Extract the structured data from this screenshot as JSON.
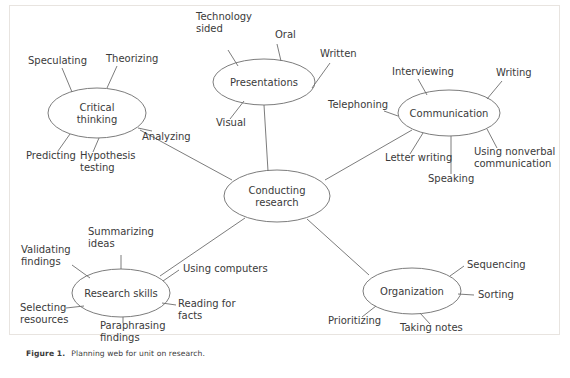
{
  "figure": {
    "caption_label": "Figure 1.",
    "caption_text": "Planning web for unit on research.",
    "border_color": "#e8e4e0",
    "line_color": "#6d6d6d",
    "text_color": "#3a3a3a",
    "background": "#ffffff"
  },
  "diagram_data": {
    "type": "mind-map",
    "center": {
      "id": "conducting-research",
      "label_line1": "Conducting",
      "label_line2": "research",
      "cx": 277,
      "cy": 196,
      "rx": 53,
      "ry": 26
    },
    "branches": [
      {
        "id": "critical-thinking",
        "label_line1": "Critical",
        "label_line2": "thinking",
        "cx": 97,
        "cy": 113,
        "rx": 49,
        "ry": 25,
        "leaves": [
          {
            "id": "speculating",
            "text": "Speculating",
            "x": 28,
            "y": 64,
            "anchor": "start",
            "ex": 72,
            "ey": 92,
            "lx": 62,
            "ly": 68
          },
          {
            "id": "theorizing",
            "text": "Theorizing",
            "x": 106,
            "y": 62,
            "anchor": "start",
            "ex": 107,
            "ey": 88,
            "lx": 117,
            "ly": 66
          },
          {
            "id": "analyzing",
            "text": "Analyzing",
            "x": 142,
            "y": 140,
            "anchor": "start",
            "ex": 138,
            "ey": 128,
            "lx": 152,
            "ly": 131
          },
          {
            "id": "predicting",
            "text": "Predicting",
            "x": 26,
            "y": 159,
            "anchor": "start",
            "ex": 70,
            "ey": 134,
            "lx": 58,
            "ly": 151
          },
          {
            "id": "hypothesis-testing",
            "text": "Hypothesis",
            "text2": "testing",
            "x": 80,
            "y": 159,
            "anchor": "start",
            "ex": 99,
            "ey": 138,
            "lx": 93,
            "ly": 152
          }
        ]
      },
      {
        "id": "presentations",
        "label_line1": "Presentations",
        "label_line2": "",
        "cx": 264,
        "cy": 82,
        "rx": 51,
        "ry": 23,
        "leaves": [
          {
            "id": "technology-sided",
            "text": "Technology",
            "text2": "sided",
            "x": 196,
            "y": 20,
            "anchor": "start",
            "ex": 238,
            "ey": 66,
            "lx": 228,
            "ly": 50
          },
          {
            "id": "oral",
            "text": "Oral",
            "x": 275,
            "y": 38,
            "anchor": "start",
            "ex": 281,
            "ey": 61,
            "lx": 277,
            "ly": 44
          },
          {
            "id": "written",
            "text": "Written",
            "x": 320,
            "y": 57,
            "anchor": "start",
            "ex": 312,
            "ey": 88,
            "lx": 330,
            "ly": 63
          },
          {
            "id": "visual",
            "text": "Visual",
            "x": 216,
            "y": 126,
            "anchor": "start",
            "ex": 244,
            "ey": 101,
            "lx": 230,
            "ly": 119
          }
        ]
      },
      {
        "id": "communication",
        "label_line1": "Communication",
        "label_line2": "",
        "cx": 449,
        "cy": 113,
        "rx": 51,
        "ry": 23,
        "leaves": [
          {
            "id": "interviewing",
            "text": "Interviewing",
            "x": 392,
            "y": 75,
            "anchor": "start",
            "ex": 427,
            "ey": 95,
            "lx": 418,
            "ly": 79
          },
          {
            "id": "writing",
            "text": "Writing",
            "x": 496,
            "y": 76,
            "anchor": "start",
            "ex": 487,
            "ey": 99,
            "lx": 502,
            "ly": 81
          },
          {
            "id": "telephoning",
            "text": "Telephoning",
            "x": 328,
            "y": 108,
            "anchor": "start",
            "ex": 398,
            "ey": 116,
            "lx": 384,
            "ly": 111
          },
          {
            "id": "letter-writing",
            "text": "Letter writing",
            "x": 385,
            "y": 161,
            "anchor": "start",
            "ex": 423,
            "ey": 133,
            "lx": 410,
            "ly": 154
          },
          {
            "id": "speaking",
            "text": "Speaking",
            "x": 428,
            "y": 182,
            "anchor": "start",
            "ex": 451,
            "ey": 136,
            "lx": 451,
            "ly": 174
          },
          {
            "id": "using-nonverbal",
            "text": "Using nonverbal",
            "text2": "communication",
            "x": 474,
            "y": 155,
            "anchor": "start",
            "ex": 487,
            "ey": 129,
            "lx": 497,
            "ly": 148
          }
        ]
      },
      {
        "id": "research-skills",
        "label_line1": "Research skills",
        "label_line2": "",
        "cx": 121,
        "cy": 293,
        "rx": 49,
        "ry": 24,
        "leaves": [
          {
            "id": "summarizing-ideas",
            "text": "Summarizing",
            "text2": "ideas",
            "x": 88,
            "y": 235,
            "anchor": "start",
            "ex": 121,
            "ey": 269,
            "lx": 121,
            "ly": 255
          },
          {
            "id": "validating-findings",
            "text": "Validating",
            "text2": "findings",
            "x": 21,
            "y": 253,
            "anchor": "start",
            "ex": 90,
            "ey": 278,
            "lx": 72,
            "ly": 265
          },
          {
            "id": "using-computers",
            "text": "Using computers",
            "x": 183,
            "y": 272,
            "anchor": "start",
            "ex": 163,
            "ey": 281,
            "lx": 179,
            "ly": 270
          },
          {
            "id": "selecting-resources",
            "text": "Selecting",
            "text2": "resources",
            "x": 20,
            "y": 311,
            "anchor": "start",
            "ex": 84,
            "ey": 306,
            "lx": 66,
            "ly": 308
          },
          {
            "id": "paraphrasing-findings",
            "text": "Paraphrasing",
            "text2": "findings",
            "x": 100,
            "y": 329,
            "anchor": "start",
            "ex": 123,
            "ey": 317,
            "lx": 123,
            "ly": 323
          },
          {
            "id": "reading-for-facts",
            "text": "Reading for",
            "text2": "facts",
            "x": 178,
            "y": 307,
            "anchor": "start",
            "ex": 162,
            "ey": 303,
            "lx": 176,
            "ly": 305
          }
        ]
      },
      {
        "id": "organization",
        "label_line1": "Organization",
        "label_line2": "",
        "cx": 412,
        "cy": 291,
        "rx": 49,
        "ry": 23,
        "leaves": [
          {
            "id": "sequencing",
            "text": "Sequencing",
            "x": 467,
            "y": 268,
            "anchor": "start",
            "ex": 450,
            "ey": 276,
            "lx": 464,
            "ly": 266
          },
          {
            "id": "sorting",
            "text": "Sorting",
            "x": 478,
            "y": 298,
            "anchor": "start",
            "ex": 458,
            "ey": 294,
            "lx": 474,
            "ly": 295
          },
          {
            "id": "prioritizing",
            "text": "Prioritizing",
            "x": 328,
            "y": 324,
            "anchor": "start",
            "ex": 376,
            "ey": 306,
            "lx": 362,
            "ly": 317
          },
          {
            "id": "taking-notes",
            "text": "Taking notes",
            "x": 400,
            "y": 331,
            "anchor": "start",
            "ex": 420,
            "ey": 313,
            "lx": 430,
            "ly": 324
          }
        ]
      }
    ],
    "spokes": [
      {
        "id": "center-to-presentations",
        "x1": 264,
        "y1": 105,
        "x2": 268,
        "y2": 171
      },
      {
        "id": "center-to-critical-thinking",
        "x1": 140,
        "y1": 130,
        "x2": 232,
        "y2": 180
      },
      {
        "id": "center-to-communication",
        "x1": 412,
        "y1": 130,
        "x2": 325,
        "y2": 180
      },
      {
        "id": "center-to-research-skills",
        "x1": 160,
        "y1": 276,
        "x2": 245,
        "y2": 218
      },
      {
        "id": "center-to-organization",
        "x1": 369,
        "y1": 275,
        "x2": 307,
        "y2": 219
      }
    ]
  }
}
